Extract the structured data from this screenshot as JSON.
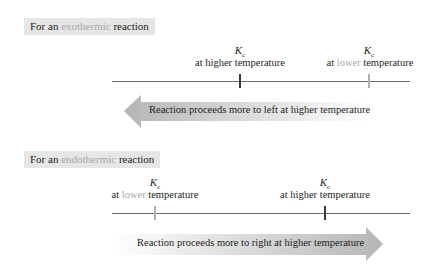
{
  "exothermic": {
    "label_prefix": "For an ",
    "label_accent": "exothermic",
    "label_suffix": " reaction",
    "marker_high": {
      "symbol": "K",
      "subscript": "c",
      "prefix": "at ",
      "accent": "higher",
      "suffix": " temperature"
    },
    "marker_low": {
      "symbol": "K",
      "subscript": "c",
      "prefix": "at ",
      "accent": "lower",
      "suffix": " temperature"
    },
    "arrow_direction": "left",
    "arrow_text": "Reaction proceeds more to left at higher temperature"
  },
  "endothermic": {
    "label_prefix": "For an ",
    "label_accent": "endothermic",
    "label_suffix": " reaction",
    "marker_low": {
      "symbol": "K",
      "subscript": "c",
      "prefix": "at ",
      "accent": "lower",
      "suffix": " temperature"
    },
    "marker_high": {
      "symbol": "K",
      "subscript": "c",
      "prefix": "at ",
      "accent": "higher",
      "suffix": " temperature"
    },
    "arrow_direction": "right",
    "arrow_text": "Reaction proceeds more to right at higher temperature"
  },
  "colors": {
    "label_bg": "#e6e6e6",
    "accent_text": "#a8a8a8",
    "dark_tick": "#3a3a3a",
    "light_tick": "#b0b0b0",
    "arrow_gray": "#b8b8b8"
  }
}
